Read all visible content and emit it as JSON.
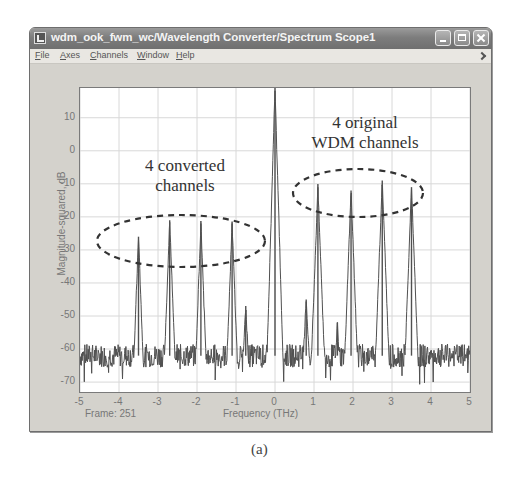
{
  "window": {
    "title": "wdm_ook_fwm_wc/Wavelength Converter/Spectrum Scope1",
    "controls": [
      "minimize",
      "maximize",
      "close"
    ]
  },
  "menubar": {
    "items": [
      {
        "label": "File",
        "accel": "F",
        "rest": "ile"
      },
      {
        "label": "Axes",
        "accel": "A",
        "rest": "xes"
      },
      {
        "label": "Channels",
        "accel": "C",
        "rest": "hannels"
      },
      {
        "label": "Window",
        "accel": "W",
        "rest": "indow"
      },
      {
        "label": "Help",
        "accel": "H",
        "rest": "elp"
      }
    ]
  },
  "status": {
    "frame_label": "Frame: 251"
  },
  "caption": "(a)",
  "chart_data": {
    "type": "line",
    "title": "",
    "xlabel": "Frequency (THz)",
    "ylabel": "Magnitude-squared, dB",
    "xlim": [
      -5,
      5
    ],
    "ylim": [
      -73,
      19
    ],
    "xticks": [
      -5,
      -4,
      -3,
      -2,
      -1,
      0,
      1,
      2,
      3,
      4,
      5
    ],
    "yticks": [
      10,
      0,
      -10,
      -20,
      -30,
      -40,
      -50,
      -60,
      -70
    ],
    "grid": true,
    "line_color": "#505050",
    "noise_floor_db": -62,
    "noise_floor_range_db": [
      -70,
      -57
    ],
    "noise_trace_note": "fine noise texture is generated procedurally at render time, not read from the image",
    "peaks": [
      {
        "group": "converted",
        "x": -3.5,
        "y": -26
      },
      {
        "group": "converted",
        "x": -2.7,
        "y": -21
      },
      {
        "group": "converted",
        "x": -1.9,
        "y": -22
      },
      {
        "group": "converted",
        "x": -1.1,
        "y": -22
      },
      {
        "group": "fwm_product",
        "x": -0.75,
        "y": -47
      },
      {
        "group": "pump",
        "x": 0.0,
        "y": 19
      },
      {
        "group": "fwm_product",
        "x": 0.8,
        "y": -45
      },
      {
        "group": "original",
        "x": 1.1,
        "y": -11
      },
      {
        "group": "fwm_product",
        "x": 1.6,
        "y": -52
      },
      {
        "group": "original",
        "x": 1.95,
        "y": -12
      },
      {
        "group": "original",
        "x": 2.75,
        "y": -9
      },
      {
        "group": "original",
        "x": 3.5,
        "y": -11
      }
    ],
    "annotations": [
      {
        "text_lines": [
          "4 converted",
          "channels"
        ],
        "target_group": "converted"
      },
      {
        "text_lines": [
          "4 original",
          "WDM channels"
        ],
        "target_group": "original"
      }
    ],
    "series": [
      {
        "name": "spectrum",
        "description": "optical spectrum with 4 converted channels, a pump/center line at 0 THz, and 4 original WDM channels"
      }
    ]
  }
}
